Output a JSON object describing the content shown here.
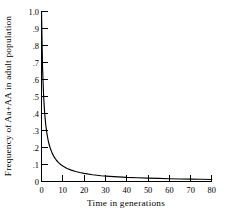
{
  "chart_data": {
    "type": "line",
    "title": "",
    "subtitle": "",
    "xlabel": "Time in generations",
    "ylabel": "Frequency of Aa+AA in adult population",
    "xlim": [
      0,
      80
    ],
    "ylim": [
      0,
      1.0
    ],
    "grid": false,
    "legend": null,
    "legend_position": "none",
    "x_ticks": [
      0,
      10,
      20,
      30,
      40,
      50,
      60,
      70,
      80
    ],
    "x_tick_labels": [
      "0",
      "10",
      "20",
      "30",
      "40",
      "50",
      "60",
      "70",
      "80"
    ],
    "y_ticks": [
      0,
      0.1,
      0.2,
      0.3,
      0.4,
      0.5,
      0.6,
      0.7,
      0.8,
      0.9,
      1.0
    ],
    "y_tick_labels": [
      "0",
      ".1",
      ".2",
      ".3",
      ".4",
      ".5",
      ".6",
      ".7",
      ".8",
      ".9",
      "1.0"
    ],
    "tick_direction": "in",
    "series": [
      {
        "name": "Frequency of Aa+AA",
        "formula": "f(t) = 1 / (1 + t)",
        "x": [
          0,
          0.5,
          1,
          1.5,
          2,
          2.5,
          3,
          3.5,
          4,
          5,
          6,
          7,
          8,
          9,
          10,
          12,
          14,
          16,
          18,
          20,
          24,
          28,
          32,
          36,
          40,
          45,
          50,
          55,
          60,
          65,
          70,
          75,
          80
        ],
        "y": [
          1.0,
          0.667,
          0.5,
          0.4,
          0.333,
          0.286,
          0.25,
          0.222,
          0.2,
          0.167,
          0.143,
          0.125,
          0.111,
          0.1,
          0.091,
          0.077,
          0.067,
          0.059,
          0.053,
          0.048,
          0.04,
          0.034,
          0.03,
          0.027,
          0.024,
          0.022,
          0.02,
          0.018,
          0.016,
          0.015,
          0.014,
          0.013,
          0.012
        ]
      }
    ],
    "annotations": []
  },
  "axes": {
    "y_title": "Frequency of Aa+AA in adult population",
    "x_title": "Time in generations"
  },
  "caption": {
    "text": ""
  },
  "colors": {
    "line": "#000000",
    "axis": "#000000",
    "background": "#ffffff"
  }
}
